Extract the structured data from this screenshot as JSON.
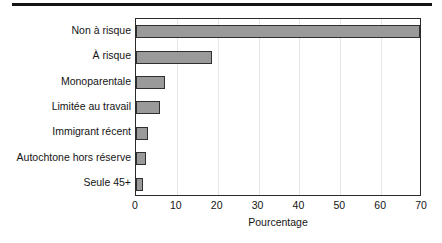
{
  "chart_data": {
    "type": "bar",
    "orientation": "horizontal",
    "title": "",
    "subtitle": "",
    "xlabel": "Pourcentage",
    "ylabel": "",
    "xlim": [
      0,
      70
    ],
    "xticks": [
      "0",
      "10",
      "20",
      "30",
      "40",
      "50",
      "60",
      "70"
    ],
    "xtick_values": [
      0,
      10,
      20,
      30,
      40,
      50,
      60,
      70
    ],
    "grid": "vertical",
    "legend": "none",
    "categories": [
      "Non à risque",
      "À risque",
      "Monoparentale",
      "Limitée au travail",
      "Immigrant récent",
      "Autochtone hors réserve",
      "Seule 45+"
    ],
    "values": [
      69.4,
      18.5,
      7.2,
      5.8,
      3.0,
      2.4,
      1.8
    ],
    "series": [
      {
        "name": "Pourcentage",
        "values": [
          69.4,
          18.5,
          7.2,
          5.8,
          3.0,
          2.4,
          1.8
        ]
      }
    ],
    "colors": {
      "bar_fill": "#9a9a9a",
      "bar_border": "#2f2f2f",
      "axis": "#2b2b2b",
      "gridline": "#e6e6e6",
      "text": "#141414",
      "rule": "#141414"
    }
  }
}
